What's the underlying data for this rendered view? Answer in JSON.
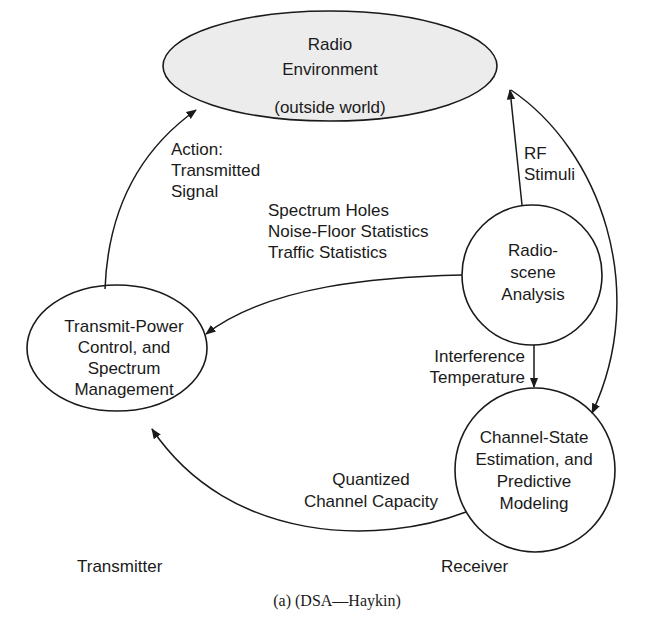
{
  "diagram": {
    "nodes": {
      "radio_environment": {
        "lines": [
          "Radio",
          "Environment",
          "(outside world)"
        ],
        "fill": "#ececec"
      },
      "radio_scene_analysis": {
        "lines": [
          "Radio-",
          "scene",
          "Analysis"
        ]
      },
      "transmit_power_control": {
        "lines": [
          "Transmit-Power",
          "Control, and",
          "Spectrum",
          "Management"
        ]
      },
      "channel_state_estimation": {
        "lines": [
          "Channel-State",
          "Estimation, and",
          "Predictive",
          "Modeling"
        ]
      }
    },
    "edges": {
      "action": {
        "lines": [
          "Action:",
          "Transmitted",
          "Signal"
        ],
        "from": "Transmit-Power Control, and Spectrum Management",
        "to": "Radio Environment"
      },
      "rf_stimuli": {
        "lines": [
          "RF",
          "Stimuli"
        ],
        "from": "Radio Environment",
        "to": "Radio-scene Analysis / Channel-State Estimation"
      },
      "spectrum_info": {
        "lines": [
          "Spectrum Holes",
          "Noise-Floor Statistics",
          "Traffic Statistics"
        ],
        "from": "Radio-scene Analysis",
        "to": "Transmit-Power Control, and Spectrum Management"
      },
      "interference": {
        "lines": [
          "Interference",
          "Temperature"
        ],
        "from": "Radio-scene Analysis",
        "to": "Channel-State Estimation, and Predictive Modeling"
      },
      "capacity": {
        "lines": [
          "Quantized",
          "Channel Capacity"
        ],
        "from": "Channel-State Estimation, and Predictive Modeling",
        "to": "Transmit-Power Control, and Spectrum Management"
      }
    },
    "side_labels": {
      "left": "Transmitter",
      "right": "Receiver"
    },
    "caption": "(a) (DSA—Haykin)"
  }
}
